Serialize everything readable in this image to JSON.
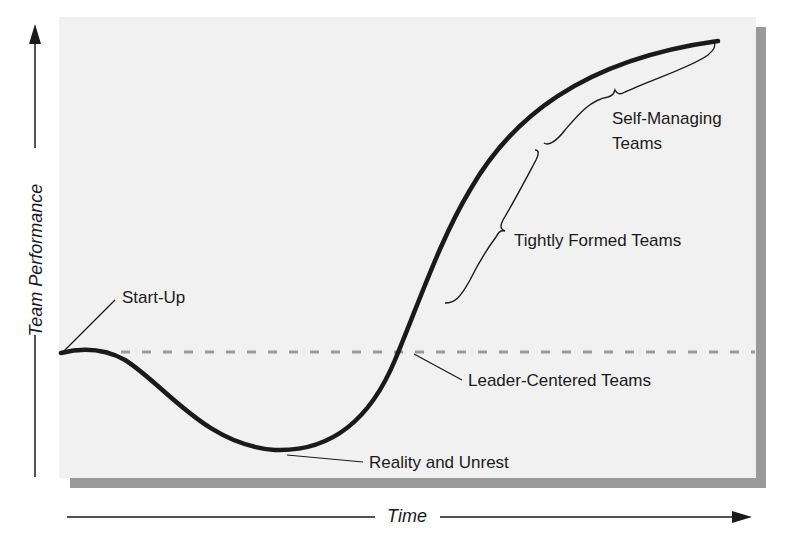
{
  "diagram": {
    "type": "team-performance-curve",
    "axes": {
      "y_label": "Team Performance",
      "x_label": "Time"
    },
    "stages": [
      {
        "id": "start-up",
        "label": "Start-Up"
      },
      {
        "id": "reality-unrest",
        "label": "Reality and Unrest"
      },
      {
        "id": "leader-centered",
        "label": "Leader-Centered Teams"
      },
      {
        "id": "tightly-formed",
        "label": "Tightly Formed Teams"
      },
      {
        "id": "self-managing",
        "label": "Self-Managing Teams",
        "line1": "Self-Managing",
        "line2": "Teams"
      }
    ],
    "baseline": {
      "style": "dashed",
      "description": "Starting performance level"
    },
    "colors": {
      "panel": "#f1f1f1",
      "shadow": "#9a9a9a",
      "curve": "#1a1a1a",
      "baseline": "#9a9a9a"
    }
  }
}
